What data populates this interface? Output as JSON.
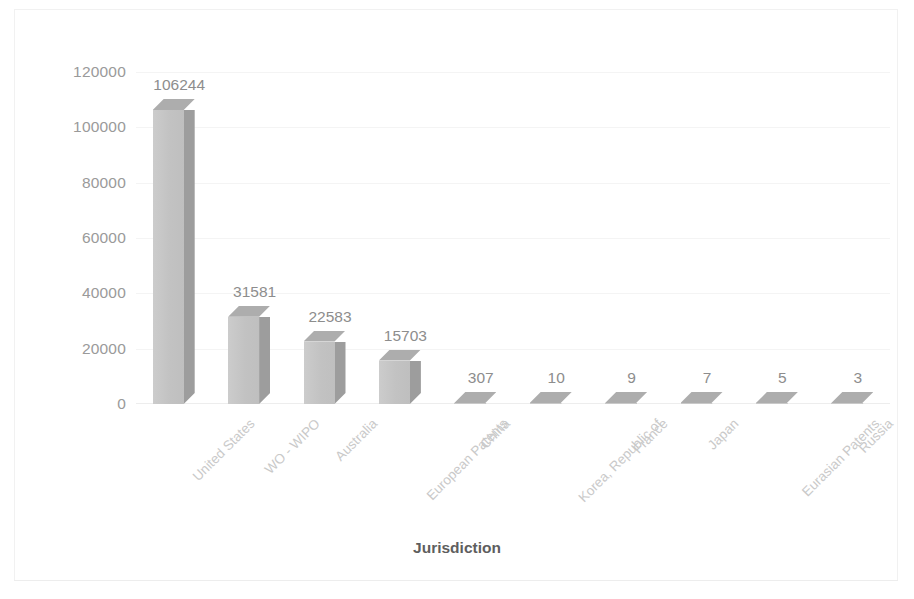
{
  "chart_data": {
    "type": "bar",
    "title": "",
    "subtitle": "",
    "xlabel": "Jurisdiction",
    "ylabel": "No. of Patents",
    "ylim": [
      0,
      120000
    ],
    "yticks": [
      0,
      20000,
      40000,
      60000,
      80000,
      100000,
      120000
    ],
    "ytick_labels": [
      "0",
      "20000",
      "40000",
      "60000",
      "80000",
      "100000",
      "120000"
    ],
    "grid": true,
    "legend": null,
    "style": "3d-column",
    "bar_color": "#c4c4c4",
    "bar_side_color": "#9d9d9d",
    "bar_top_color": "#adadad",
    "label_color": "#8d8d8d",
    "axis_title_color": "#5e5e5e",
    "categories": [
      "United States",
      "WO - WIPO",
      "Australia",
      "European Patents",
      "China",
      "Korea, Republic of",
      "France",
      "Japan",
      "Eurasian Patents",
      "Russia"
    ],
    "values": [
      106244,
      31581,
      22583,
      15703,
      307,
      10,
      9,
      7,
      5,
      3
    ],
    "value_labels": [
      "106244",
      "31581",
      "22583",
      "15703",
      "307",
      "10",
      "9",
      "7",
      "5",
      "3"
    ]
  }
}
